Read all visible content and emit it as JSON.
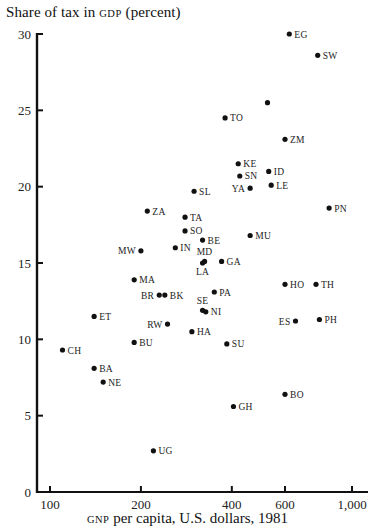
{
  "chart_data": {
    "type": "scatter",
    "title": "",
    "ylabel": "Share of tax in GDP (percent)",
    "ylabel_prefix": "Share of tax in ",
    "ylabel_sc": "gdp",
    "ylabel_suffix": " (percent)",
    "xlabel": "GNP per capita, U.S. dollars, 1981",
    "xlabel_sc": "gnp",
    "xlabel_suffix": " per capita, U.S. dollars, 1981",
    "x_scale": "log",
    "xlim": [
      92,
      1050
    ],
    "ylim": [
      0,
      30
    ],
    "x_ticks": [
      100,
      200,
      400,
      600,
      1000
    ],
    "x_tick_labels": [
      "100",
      "200",
      "400",
      "600",
      "1,000"
    ],
    "y_ticks": [
      0,
      5,
      10,
      15,
      20,
      25,
      30
    ],
    "y_tick_labels": [
      "0",
      "5",
      "10",
      "15",
      "20",
      "25",
      "30"
    ],
    "grid": false,
    "legend": null,
    "points": [
      {
        "label": "EG",
        "x": 620,
        "y": 30.0,
        "pos": "right"
      },
      {
        "label": "SW",
        "x": 770,
        "y": 28.6,
        "pos": "right"
      },
      {
        "label": "",
        "x": 525,
        "y": 25.5,
        "pos": "right"
      },
      {
        "label": "TO",
        "x": 380,
        "y": 24.5,
        "pos": "right"
      },
      {
        "label": "ZM",
        "x": 600,
        "y": 23.1,
        "pos": "right"
      },
      {
        "label": "KE",
        "x": 420,
        "y": 21.5,
        "pos": "right"
      },
      {
        "label": "ID",
        "x": 530,
        "y": 21.0,
        "pos": "right"
      },
      {
        "label": "SN",
        "x": 425,
        "y": 20.7,
        "pos": "right"
      },
      {
        "label": "LE",
        "x": 540,
        "y": 20.1,
        "pos": "right"
      },
      {
        "label": "YA",
        "x": 460,
        "y": 19.9,
        "pos": "left"
      },
      {
        "label": "SL",
        "x": 300,
        "y": 19.7,
        "pos": "right"
      },
      {
        "label": "PN",
        "x": 840,
        "y": 18.6,
        "pos": "right"
      },
      {
        "label": "ZA",
        "x": 210,
        "y": 18.4,
        "pos": "right"
      },
      {
        "label": "TA",
        "x": 280,
        "y": 18.0,
        "pos": "right"
      },
      {
        "label": "SO",
        "x": 280,
        "y": 17.1,
        "pos": "right"
      },
      {
        "label": "MU",
        "x": 460,
        "y": 16.8,
        "pos": "right"
      },
      {
        "label": "BE",
        "x": 320,
        "y": 16.5,
        "pos": "right"
      },
      {
        "label": "IN",
        "x": 260,
        "y": 16.0,
        "pos": "right"
      },
      {
        "label": "MW",
        "x": 200,
        "y": 15.8,
        "pos": "left"
      },
      {
        "label": "MD",
        "x": 325,
        "y": 15.1,
        "pos": "above"
      },
      {
        "label": "LA",
        "x": 320,
        "y": 15.0,
        "pos": "below"
      },
      {
        "label": "GA",
        "x": 370,
        "y": 15.1,
        "pos": "right"
      },
      {
        "label": "MA",
        "x": 190,
        "y": 13.9,
        "pos": "right"
      },
      {
        "label": "HO",
        "x": 600,
        "y": 13.6,
        "pos": "right"
      },
      {
        "label": "TH",
        "x": 760,
        "y": 13.6,
        "pos": "right"
      },
      {
        "label": "PA",
        "x": 350,
        "y": 13.1,
        "pos": "right"
      },
      {
        "label": "BR",
        "x": 230,
        "y": 12.9,
        "pos": "left"
      },
      {
        "label": "BK",
        "x": 240,
        "y": 12.9,
        "pos": "right"
      },
      {
        "label": "SE",
        "x": 320,
        "y": 11.9,
        "pos": "above"
      },
      {
        "label": "NI",
        "x": 328,
        "y": 11.8,
        "pos": "right"
      },
      {
        "label": "ET",
        "x": 140,
        "y": 11.5,
        "pos": "right"
      },
      {
        "label": "PH",
        "x": 780,
        "y": 11.3,
        "pos": "right"
      },
      {
        "label": "ES",
        "x": 650,
        "y": 11.2,
        "pos": "left"
      },
      {
        "label": "RW",
        "x": 245,
        "y": 11.0,
        "pos": "left"
      },
      {
        "label": "HA",
        "x": 295,
        "y": 10.5,
        "pos": "right"
      },
      {
        "label": "BU",
        "x": 190,
        "y": 9.8,
        "pos": "right"
      },
      {
        "label": "SU",
        "x": 385,
        "y": 9.7,
        "pos": "right"
      },
      {
        "label": "CH",
        "x": 110,
        "y": 9.3,
        "pos": "right"
      },
      {
        "label": "BA",
        "x": 140,
        "y": 8.1,
        "pos": "right"
      },
      {
        "label": "NE",
        "x": 150,
        "y": 7.2,
        "pos": "right"
      },
      {
        "label": "BO",
        "x": 600,
        "y": 6.4,
        "pos": "right"
      },
      {
        "label": "GH",
        "x": 405,
        "y": 5.6,
        "pos": "right"
      },
      {
        "label": "UG",
        "x": 220,
        "y": 2.7,
        "pos": "right"
      }
    ]
  }
}
